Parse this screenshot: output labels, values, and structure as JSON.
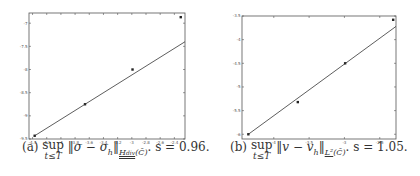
{
  "chart_data": [
    {
      "type": "scatter",
      "panel": "a",
      "title": "",
      "xlabel": "",
      "ylabel": "",
      "xlim": [
        -4.45,
        -2.25
      ],
      "ylim": [
        -9.5,
        -6.78
      ],
      "xticks": [
        -4.4,
        -4.2,
        -4,
        -3.8,
        -3.6,
        -3.4,
        -3.2,
        -3,
        -2.8,
        -2.6,
        -2.4
      ],
      "xtick_labels": [
        "-4.4",
        "-4.2",
        "-4",
        "-3.8",
        "-3.6",
        "-3.4",
        "-3.2",
        "-3",
        "-2.8",
        "-2.6",
        "-2.4"
      ],
      "yticks": [
        -7,
        -7.5,
        -8,
        -8.5,
        -9,
        -9.5
      ],
      "ytick_labels": [
        "-7",
        "-7.5",
        "-8",
        "-8.5",
        "-9",
        "-9.5"
      ],
      "grid": false,
      "series": [
        {
          "name": "error",
          "x": [
            -4.37,
            -3.66,
            -2.99,
            -2.31
          ],
          "y": [
            -9.43,
            -8.75,
            -8.0,
            -6.87
          ],
          "marker": "dot"
        },
        {
          "name": "fit",
          "x": [
            -4.37,
            -2.25
          ],
          "y": [
            -9.43,
            -7.4
          ],
          "marker": "none"
        }
      ],
      "slope": "0.96",
      "caption": {
        "label": "(a)",
        "sup": "sup",
        "sup_under": "t≤T",
        "expr": "‖σ − σ",
        "expr_sub": "h",
        "norm": "‖",
        "space": "H",
        "space_sub": "div",
        "domain": "(C̄)",
        "tail": ".  s = 0.96."
      }
    },
    {
      "type": "scatter",
      "panel": "b",
      "title": "",
      "xlabel": "",
      "ylabel": "",
      "xlim": [
        -4.45,
        -2.27
      ],
      "ylim": [
        -6.1,
        -3.5
      ],
      "xticks": [
        -4,
        -3.5,
        -3,
        -2.5
      ],
      "xtick_labels": [
        "-4",
        "-3.5",
        "-3",
        "-2.5"
      ],
      "yticks": [
        -3.5,
        -4,
        -4.5,
        -5,
        -5.5,
        -6
      ],
      "ytick_labels": [
        "-3.5",
        "-4",
        "-4.5",
        "-5",
        "-5.5",
        "-6"
      ],
      "grid": false,
      "series": [
        {
          "name": "error",
          "x": [
            -4.36,
            -3.66,
            -2.99,
            -2.31
          ],
          "y": [
            -6.0,
            -5.32,
            -4.5,
            -3.58
          ],
          "marker": "dot"
        },
        {
          "name": "fit",
          "x": [
            -4.36,
            -2.27
          ],
          "y": [
            -6.0,
            -3.72
          ],
          "marker": "none"
        }
      ],
      "slope": "1.05",
      "caption": {
        "label": "(b)",
        "sup": "sup",
        "sup_under": "t≤T",
        "expr": "‖v − v",
        "expr_sub": "h",
        "norm": "‖",
        "space": "L²",
        "space_sub": "",
        "domain": "(C̄)",
        "tail": ".  s = 1.05."
      }
    }
  ],
  "colors": {
    "axis": "#555555",
    "line": "#333333",
    "marker": "#222222",
    "background": "#ffffff"
  }
}
